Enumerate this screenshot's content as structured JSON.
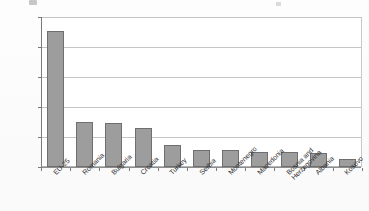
{
  "chart_data": {
    "type": "bar",
    "title": "",
    "subtitle": "",
    "xlabel": "",
    "ylabel": "",
    "ylim": [
      0,
      25000
    ],
    "grid": true,
    "legend_position": "none",
    "orientation": "vertical",
    "bar_color": "#9d9d9d",
    "bar_border_color": "#6f6f6f",
    "gridline_color": "#c4c4c4",
    "axis_color": "#7a7a7a",
    "tick_label_decimal_separator": ",",
    "categories": [
      "EU-25",
      "Romania",
      "Bulgaria",
      "Croatia",
      "Turkey",
      "Serbia",
      "Montenegro",
      "Macedonia",
      "Bosnia and Herzegovina",
      "Albania",
      "Kosovo"
    ],
    "category_label_lines": [
      [
        "EU-25"
      ],
      [
        "Romania"
      ],
      [
        "Bulgaria"
      ],
      [
        "Croatia"
      ],
      [
        "Turkey"
      ],
      [
        "Serbia"
      ],
      [
        "Montenegro"
      ],
      [
        "Macedonia"
      ],
      [
        "Bosnia and",
        "Herzegovina"
      ],
      [
        "Albania"
      ],
      [
        "Kosovo"
      ]
    ],
    "values": [
      22600,
      7450,
      7350,
      6550,
      3600,
      2900,
      2850,
      2500,
      2500,
      2300,
      1400
    ],
    "ytick_values": [
      25000,
      20000,
      15000,
      10000,
      5000,
      0
    ],
    "ytick_labels": [
      "25000,00",
      "20000.00",
      "15000.00",
      "10000.00",
      "5000.00",
      "0.00"
    ]
  }
}
